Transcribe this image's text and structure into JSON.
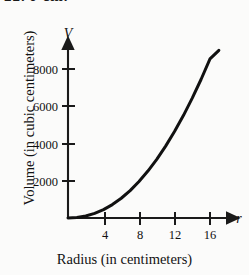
{
  "page": {
    "cropped_header_text": "22.   r          cm."
  },
  "chart_data": {
    "type": "line",
    "title": "",
    "subtitle": "",
    "xlabel": "Radius (in centimeters)",
    "ylabel": "Volume (in cubic centimeters)",
    "x_axis_symbol": "r",
    "y_axis_symbol": "V",
    "xlim": [
      0,
      17.6
    ],
    "ylim": [
      0,
      9600
    ],
    "grid": false,
    "legend": null,
    "xticks": [
      4,
      8,
      12,
      16
    ],
    "xtick_labels": [
      "4",
      "8",
      "12",
      "16"
    ],
    "yticks": [
      2000,
      4000,
      6000,
      8000
    ],
    "ytick_labels": [
      "2000",
      "4000",
      "6000",
      "8000"
    ],
    "series": [
      {
        "name": "Volume of sphere",
        "color": "#111111",
        "line_width": 3,
        "x": [
          0,
          1,
          2,
          3,
          4,
          5,
          6,
          7,
          8,
          9,
          10,
          11,
          12,
          13,
          14,
          15,
          16,
          17
        ],
        "y": [
          0,
          30,
          110,
          250,
          450,
          720,
          1060,
          1470,
          1960,
          2520,
          3150,
          3860,
          4640,
          5500,
          6440,
          7450,
          8540,
          9000
        ]
      }
    ],
    "annotations": []
  },
  "colors": {
    "background": "#fbfbfa",
    "ink": "#111111",
    "axis": "#1a1a1a"
  }
}
